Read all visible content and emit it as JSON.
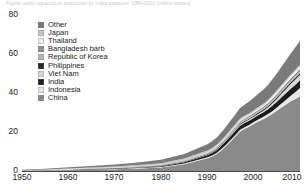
{
  "title_strip": "Figure: world aquaculture production by major producer, 1950-2010 (million tonnes)",
  "axes": {
    "y_ticks": [
      "80",
      "60",
      "40",
      "20",
      "0"
    ],
    "x_ticks": [
      "1950",
      "1960",
      "1970",
      "1980",
      "1990",
      "2000",
      "2010"
    ]
  },
  "legend": {
    "items": [
      {
        "label": "Other",
        "color": "#7a7a7a"
      },
      {
        "label": "Japan",
        "color": "#c6c6c6"
      },
      {
        "label": "Thailand",
        "color": "#efefef"
      },
      {
        "label": "Bangladesh barb",
        "color": "#8e8e8e"
      },
      {
        "label": "Republic of Korea",
        "color": "#b9b9b9"
      },
      {
        "label": "Philippines",
        "color": "#262626"
      },
      {
        "label": "Viet Nam",
        "color": "#d8d8d8"
      },
      {
        "label": "India",
        "color": "#1c1c1c"
      },
      {
        "label": "Indonesia",
        "color": "#e6e6e6"
      },
      {
        "label": "China",
        "color": "#8a8a8a"
      }
    ]
  },
  "chart_data": {
    "type": "area",
    "stacked": true,
    "title": "World aquaculture production by major producer",
    "xlabel": "",
    "ylabel": "",
    "xlim": [
      1950,
      2010
    ],
    "ylim": [
      0,
      80
    ],
    "grid": false,
    "legend_position": "inside-top-left",
    "x": [
      1950,
      1955,
      1960,
      1965,
      1970,
      1975,
      1980,
      1985,
      1990,
      1991,
      1992,
      1993,
      1994,
      1995,
      1996,
      1997,
      1998,
      1999,
      2000,
      2001,
      2002,
      2003,
      2004,
      2005,
      2006,
      2007,
      2008,
      2009,
      2010
    ],
    "series": [
      {
        "name": "China",
        "color": "#8a8a8a",
        "values": [
          0.1,
          0.2,
          0.5,
          0.7,
          0.9,
          1.3,
          1.8,
          3.5,
          6.5,
          7.4,
          8.6,
          10.5,
          12.6,
          15.0,
          17.4,
          20.0,
          21.5,
          22.6,
          24.0,
          25.2,
          26.3,
          27.6,
          29.0,
          30.7,
          32.4,
          33.9,
          35.5,
          36.7,
          38.0
        ]
      },
      {
        "name": "Indonesia",
        "color": "#e6e6e6",
        "values": [
          0.05,
          0.07,
          0.1,
          0.12,
          0.15,
          0.2,
          0.25,
          0.35,
          0.5,
          0.55,
          0.6,
          0.65,
          0.7,
          0.75,
          0.8,
          0.85,
          0.85,
          0.9,
          0.95,
          1.1,
          1.2,
          1.3,
          1.5,
          1.7,
          2.0,
          2.4,
          2.8,
          3.5,
          4.3
        ]
      },
      {
        "name": "India",
        "color": "#1c1c1c",
        "values": [
          0.05,
          0.08,
          0.1,
          0.15,
          0.2,
          0.3,
          0.4,
          0.6,
          1.0,
          1.2,
          1.4,
          1.6,
          1.8,
          1.9,
          2.0,
          2.1,
          2.1,
          2.1,
          2.1,
          2.2,
          2.3,
          2.4,
          2.7,
          2.9,
          3.2,
          3.4,
          3.6,
          3.8,
          4.0
        ]
      },
      {
        "name": "Viet Nam",
        "color": "#d8d8d8",
        "values": [
          0.01,
          0.02,
          0.03,
          0.04,
          0.06,
          0.08,
          0.1,
          0.15,
          0.2,
          0.22,
          0.25,
          0.28,
          0.3,
          0.38,
          0.42,
          0.48,
          0.52,
          0.58,
          0.65,
          0.7,
          0.78,
          0.9,
          1.2,
          1.4,
          1.7,
          2.1,
          2.4,
          2.6,
          2.7
        ]
      },
      {
        "name": "Philippines",
        "color": "#262626",
        "values": [
          0.05,
          0.06,
          0.08,
          0.1,
          0.12,
          0.15,
          0.2,
          0.25,
          0.38,
          0.4,
          0.42,
          0.43,
          0.45,
          0.45,
          0.45,
          0.46,
          0.46,
          0.47,
          0.5,
          0.55,
          0.6,
          0.65,
          0.7,
          0.75,
          0.8,
          0.85,
          0.9,
          0.95,
          1.0
        ]
      },
      {
        "name": "Republic of Korea",
        "color": "#b9b9b9",
        "values": [
          0.02,
          0.05,
          0.1,
          0.15,
          0.2,
          0.25,
          0.3,
          0.4,
          0.5,
          0.55,
          0.6,
          0.65,
          0.7,
          0.78,
          0.8,
          0.82,
          0.78,
          0.75,
          0.65,
          0.65,
          0.65,
          0.65,
          0.7,
          0.7,
          0.75,
          0.8,
          0.8,
          0.8,
          0.8
        ]
      },
      {
        "name": "Bangladesh barb",
        "color": "#8e8e8e",
        "values": [
          0.01,
          0.02,
          0.03,
          0.05,
          0.07,
          0.1,
          0.12,
          0.18,
          0.25,
          0.3,
          0.33,
          0.37,
          0.4,
          0.45,
          0.5,
          0.55,
          0.58,
          0.62,
          0.66,
          0.7,
          0.77,
          0.85,
          0.91,
          0.95,
          1.0,
          1.05,
          1.1,
          1.2,
          1.3
        ]
      },
      {
        "name": "Thailand",
        "color": "#efefef",
        "values": [
          0.01,
          0.02,
          0.04,
          0.06,
          0.08,
          0.1,
          0.12,
          0.18,
          0.28,
          0.32,
          0.38,
          0.42,
          0.48,
          0.55,
          0.55,
          0.55,
          0.55,
          0.58,
          0.7,
          0.75,
          0.8,
          0.95,
          1.1,
          1.15,
          1.2,
          1.25,
          1.3,
          1.3,
          1.3
        ]
      },
      {
        "name": "Japan",
        "color": "#c6c6c6",
        "values": [
          0.1,
          0.2,
          0.3,
          0.4,
          0.5,
          0.6,
          0.7,
          0.8,
          0.8,
          0.8,
          0.8,
          0.8,
          0.8,
          0.8,
          0.8,
          0.8,
          0.78,
          0.76,
          0.75,
          0.75,
          0.73,
          0.72,
          0.72,
          0.72,
          0.72,
          0.72,
          0.72,
          0.72,
          0.72
        ]
      },
      {
        "name": "Other",
        "color": "#7a7a7a",
        "values": [
          0.3,
          0.4,
          0.6,
          0.8,
          1.0,
          1.3,
          1.7,
          2.3,
          3.2,
          3.4,
          3.6,
          3.9,
          4.2,
          4.6,
          5.0,
          5.4,
          5.6,
          6.0,
          6.4,
          6.8,
          7.2,
          7.6,
          8.1,
          8.7,
          9.3,
          10.0,
          10.7,
          11.5,
          12.3
        ]
      }
    ],
    "totals": [
      0.7,
      1.1,
      1.88,
      2.47,
      3.28,
      4.38,
      5.69,
      8.71,
      13.61,
      15.08,
      17.01,
      19.6,
      22.43,
      26.01,
      29.22,
      32.41,
      33.92,
      35.36,
      37.86,
      39.67,
      41.56,
      43.62,
      46.64,
      49.67,
      53.07,
      56.47,
      59.82,
      63.07,
      66.42
    ]
  }
}
